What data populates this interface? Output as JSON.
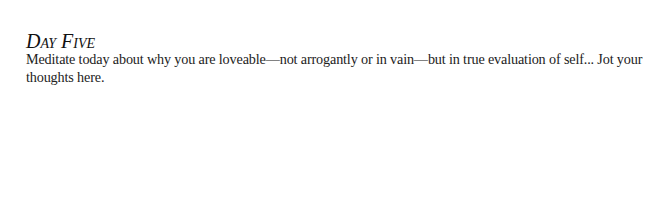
{
  "entry": {
    "title": "Day Five",
    "prompt": "Meditate today about why you are loveable—not arrogantly or in vain—but in true evaluation of self... Jot your thoughts here."
  }
}
